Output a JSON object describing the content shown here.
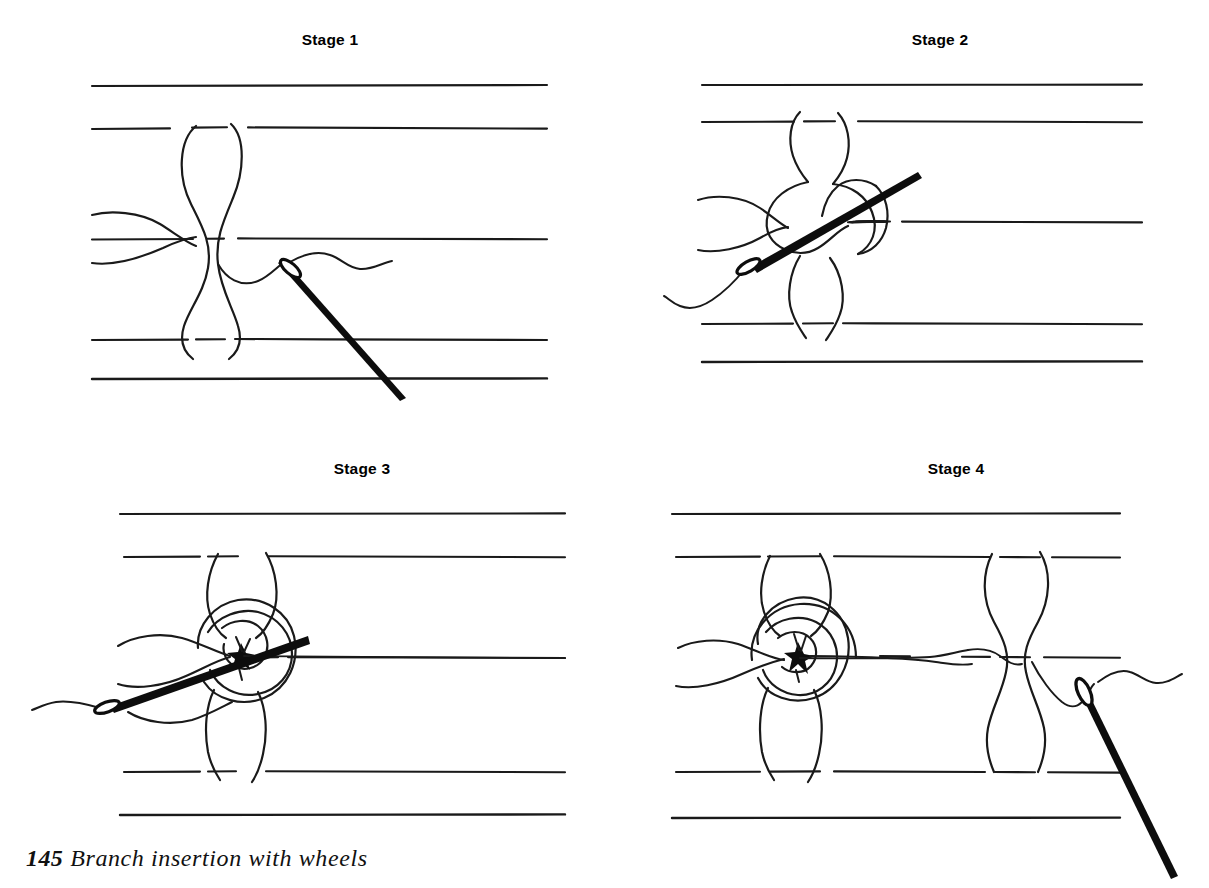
{
  "figure": {
    "caption_number": "145",
    "caption_text": "Branch insertion with wheels",
    "background_color": "#ffffff",
    "ink_color": "#1a1a1a",
    "technique": "Branch insertion with wheels",
    "total_stages": 4
  },
  "stages": [
    {
      "id": "stage-1",
      "label": "Stage 1",
      "description": "Thread forms a figure-eight between fabric threads; needle enters from upper right pointing down-right.",
      "fabric_lines": 5,
      "needle": {
        "visible": true,
        "direction": "down-right",
        "eye_position": "upper-left"
      },
      "wheel": {
        "visible": false,
        "rings": 0
      }
    },
    {
      "id": "stage-2",
      "label": "Stage 2",
      "description": "Needle passes up-right through the looped thread; eye end at lower left with trailing thread.",
      "fabric_lines": 5,
      "needle": {
        "visible": true,
        "direction": "up-right",
        "eye_position": "lower-left"
      },
      "wheel": {
        "visible": false,
        "rings": 0
      }
    },
    {
      "id": "stage-3",
      "label": "Stage 3",
      "description": "A spiral wheel is begun at the crossing point; needle enters from lower left through the centre.",
      "fabric_lines": 5,
      "needle": {
        "visible": true,
        "direction": "up-right",
        "eye_position": "lower-left"
      },
      "wheel": {
        "visible": true,
        "rings": 2
      }
    },
    {
      "id": "stage-4",
      "label": "Stage 4",
      "description": "Completed wheel at left, thread carried across to the next fabric bar; needle points down-right.",
      "fabric_lines": 5,
      "needle": {
        "visible": true,
        "direction": "down-right",
        "eye_position": "upper-left"
      },
      "wheel": {
        "visible": true,
        "rings": 3
      }
    }
  ]
}
